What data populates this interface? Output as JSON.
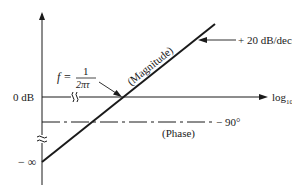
{
  "diagram": {
    "type": "bode-plot-sketch",
    "axes": {
      "y_label_zero": "0 dB",
      "y_label_bottom": "− ∞",
      "x_label_main": "log",
      "x_label_sub": "10",
      "x_label_var": "f"
    },
    "lines": {
      "magnitude": {
        "label": "(Magnitude)",
        "slope_label": "+ 20 dB/decade"
      },
      "phase": {
        "label": "(Phase)",
        "value_label": "− 90°"
      }
    },
    "annotation": {
      "f_prefix": "f =",
      "numerator": "1",
      "denominator": "2πτ"
    },
    "colors": {
      "ink": "#1a1a1a",
      "background": "#ffffff"
    }
  }
}
